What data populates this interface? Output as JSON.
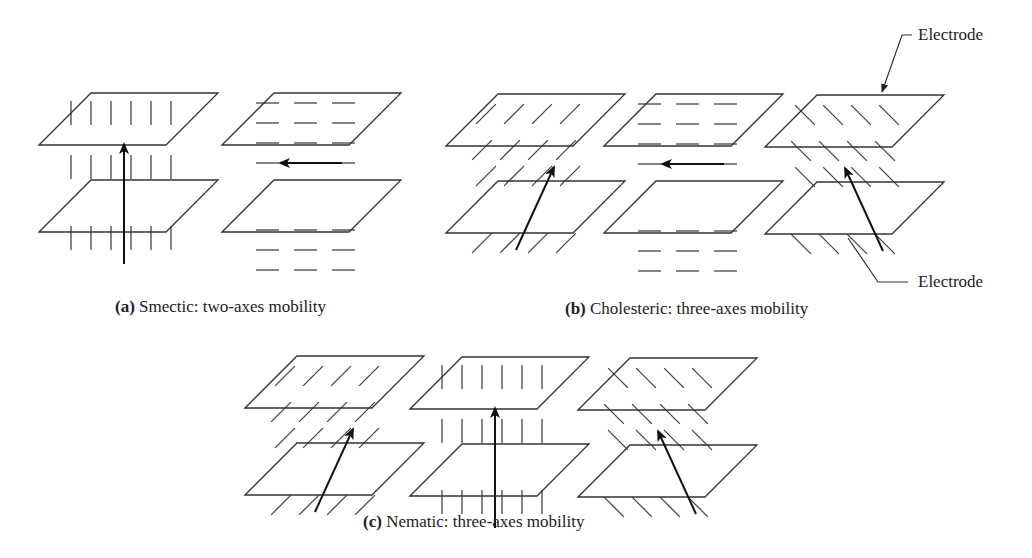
{
  "figure": {
    "panels": [
      {
        "id": "a",
        "letter": "(a)",
        "caption": " Smectic: two-axes mobility",
        "phase": "Smectic",
        "mobility": "two-axes",
        "cells": [
          {
            "molecule_orientation": "vertical",
            "arrow_direction": "up"
          },
          {
            "molecule_orientation": "horizontal",
            "arrow_direction": "left"
          }
        ]
      },
      {
        "id": "b",
        "letter": "(b)",
        "caption": " Cholesteric: three-axes mobility",
        "phase": "Cholesteric",
        "mobility": "three-axes",
        "cells": [
          {
            "molecule_orientation": "diagonal-right",
            "arrow_direction": "up-right"
          },
          {
            "molecule_orientation": "horizontal",
            "arrow_direction": "left"
          },
          {
            "molecule_orientation": "diagonal-left",
            "arrow_direction": "up-left"
          }
        ]
      },
      {
        "id": "c",
        "letter": "(c)",
        "caption": " Nematic: three-axes mobility",
        "phase": "Nematic",
        "mobility": "three-axes",
        "cells": [
          {
            "molecule_orientation": "diagonal-right",
            "arrow_direction": "up-right"
          },
          {
            "molecule_orientation": "vertical",
            "arrow_direction": "up"
          },
          {
            "molecule_orientation": "diagonal-left",
            "arrow_direction": "up-left"
          }
        ]
      }
    ],
    "labels": {
      "electrode_top": "Electrode",
      "electrode_bottom": "Electrode"
    }
  }
}
